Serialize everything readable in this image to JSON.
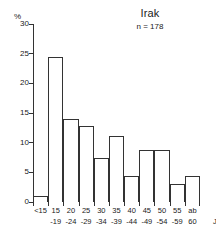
{
  "chart_data": {
    "type": "bar",
    "title": "Irak",
    "subtitle": "n = 178",
    "xlabel": "Jahre",
    "ylabel": "%",
    "ylim": [
      0,
      30
    ],
    "yticks": [
      0,
      5,
      10,
      15,
      20,
      25,
      30
    ],
    "ytick_labels": [
      "0",
      "5",
      "10",
      "15",
      "20",
      "25",
      "30"
    ],
    "grid": false,
    "legend": "none",
    "categories": [
      "<15",
      "15 -19",
      "20 -24",
      "25 -29",
      "30 -34",
      "35 -39",
      "40 -44",
      "45 -49",
      "50 -54",
      "55 -59",
      "ab 60 Jahre"
    ],
    "category_lines": [
      {
        "line1": "<15",
        "line2": ""
      },
      {
        "line1": "15",
        "line2": "-19"
      },
      {
        "line1": "20",
        "line2": "-24"
      },
      {
        "line1": "25",
        "line2": "-29"
      },
      {
        "line1": "30",
        "line2": "-34"
      },
      {
        "line1": "35",
        "line2": "-39"
      },
      {
        "line1": "40",
        "line2": "-44"
      },
      {
        "line1": "45",
        "line2": "-49"
      },
      {
        "line1": "50",
        "line2": "-54"
      },
      {
        "line1": "55",
        "line2": "-59"
      },
      {
        "line1": "ab",
        "line2": "60"
      }
    ],
    "values": [
      1.0,
      24.5,
      14.0,
      12.8,
      7.5,
      11.1,
      4.4,
      8.8,
      8.8,
      3.0,
      4.4
    ],
    "bar_style": {
      "fill": "#ffffff",
      "stroke": "#333333"
    },
    "axis_color": "#333333",
    "text_color": "#1a1a1a",
    "background": "#ffffff"
  }
}
